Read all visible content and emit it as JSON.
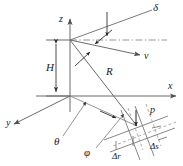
{
  "figure": {
    "type": "geometry-diagram",
    "background_color": "#ffffff",
    "line_color": "#4d4d4d",
    "text_color": "#1a1a1a"
  },
  "labels": {
    "z_axis": "z",
    "x_axis": "x",
    "y_axis": "y",
    "altitude": "H",
    "slant_range": "R",
    "velocity": "v",
    "squint": "δ",
    "incidence": "θ",
    "azimuth": "φ",
    "point_target": "p",
    "range_resolution": "Δr",
    "azimuth_resolution": "Δs"
  },
  "geometry": {
    "origin": [
      70,
      96
    ],
    "platform": [
      70,
      40
    ],
    "target": [
      136,
      124
    ],
    "x_axis_end": [
      178,
      96
    ],
    "y_axis_end": [
      10,
      126
    ],
    "z_axis_end": [
      70,
      16
    ]
  }
}
